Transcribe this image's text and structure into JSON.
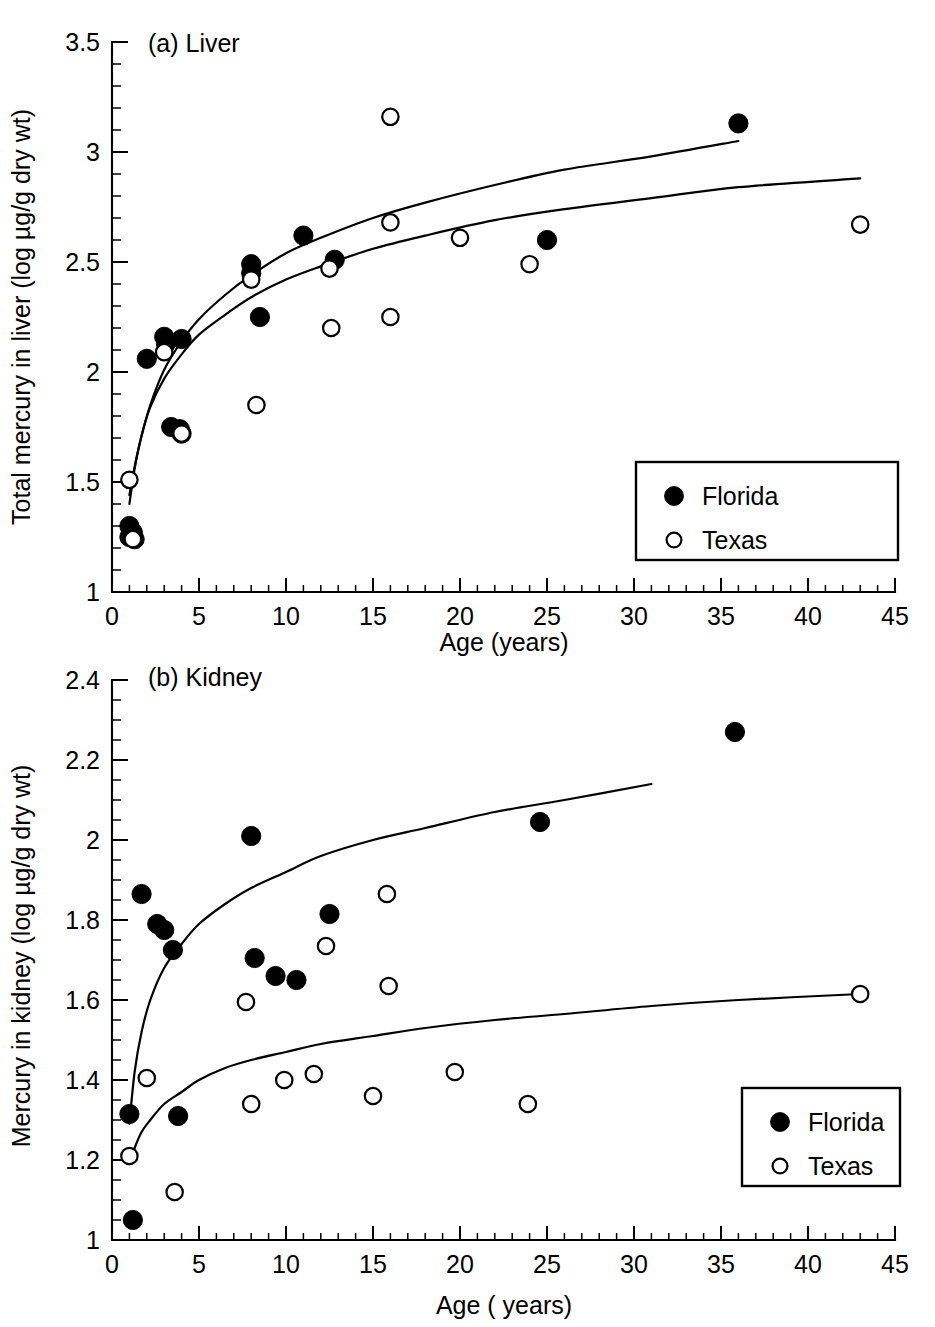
{
  "figure": {
    "background_color": "#ffffff",
    "ink_color": "#000000"
  },
  "chart_data": [
    {
      "id": "liver",
      "type": "scatter",
      "title": "(a) Liver",
      "xlabel": "Age (years)",
      "ylabel": "Total mercury in liver (log µg/g dry wt)",
      "xlim": [
        0,
        45
      ],
      "ylim": [
        1,
        3.5
      ],
      "xticks": [
        0,
        5,
        10,
        15,
        20,
        25,
        30,
        35,
        40,
        45
      ],
      "xtick_labels": [
        "0",
        "5",
        "10",
        "15",
        "20",
        "25",
        "30",
        "35",
        "40",
        "45"
      ],
      "xminor_step": 1,
      "yticks": [
        1,
        1.5,
        2,
        2.5,
        3,
        3.5
      ],
      "ytick_labels": [
        "1",
        "1.5",
        "2",
        "2.5",
        "3",
        "3.5"
      ],
      "yminor_step": 0.1,
      "grid": false,
      "legend_position": "lower right",
      "series": [
        {
          "name": "Florida",
          "marker": "filled-circle",
          "marker_color": "#000000",
          "points": [
            [
              1.0,
              1.3
            ],
            [
              1.0,
              1.25
            ],
            [
              1.2,
              1.27
            ],
            [
              1.3,
              1.24
            ],
            [
              2.0,
              2.06
            ],
            [
              3.0,
              2.16
            ],
            [
              3.1,
              2.13
            ],
            [
              4.0,
              2.15
            ],
            [
              3.4,
              1.75
            ],
            [
              3.9,
              1.74
            ],
            [
              4.0,
              1.72
            ],
            [
              8.0,
              2.49
            ],
            [
              8.0,
              2.45
            ],
            [
              8.5,
              2.25
            ],
            [
              11.0,
              2.62
            ],
            [
              12.8,
              2.51
            ],
            [
              25.0,
              2.6
            ],
            [
              36.0,
              3.13
            ]
          ],
          "fit_curve": {
            "x_range": [
              1.0,
              36.0
            ],
            "points": [
              [
                1.0,
                1.44
              ],
              [
                1.3,
                1.57
              ],
              [
                1.7,
                1.71
              ],
              [
                2.2,
                1.85
              ],
              [
                3.0,
                2.01
              ],
              [
                4.0,
                2.14
              ],
              [
                5.0,
                2.24
              ],
              [
                6.5,
                2.35
              ],
              [
                8.0,
                2.44
              ],
              [
                10.0,
                2.54
              ],
              [
                12.0,
                2.61
              ],
              [
                15.0,
                2.7
              ],
              [
                18.0,
                2.77
              ],
              [
                22.0,
                2.85
              ],
              [
                26.0,
                2.92
              ],
              [
                31.0,
                2.98
              ],
              [
                36.0,
                3.05
              ]
            ]
          }
        },
        {
          "name": "Texas",
          "marker": "open-circle",
          "marker_color": "#ffffff",
          "points": [
            [
              1.0,
              1.51
            ],
            [
              1.2,
              1.24
            ],
            [
              3.0,
              2.09
            ],
            [
              4.0,
              1.72
            ],
            [
              8.0,
              2.42
            ],
            [
              8.3,
              1.85
            ],
            [
              12.5,
              2.47
            ],
            [
              12.6,
              2.2
            ],
            [
              16.0,
              3.16
            ],
            [
              16.0,
              2.68
            ],
            [
              16.0,
              2.25
            ],
            [
              20.0,
              2.61
            ],
            [
              24.0,
              2.49
            ],
            [
              43.0,
              2.67
            ]
          ],
          "fit_curve": {
            "x_range": [
              1.0,
              43.0
            ],
            "points": [
              [
                1.0,
                1.4
              ],
              [
                1.3,
                1.56
              ],
              [
                1.7,
                1.71
              ],
              [
                2.2,
                1.84
              ],
              [
                3.0,
                1.97
              ],
              [
                4.0,
                2.08
              ],
              [
                5.0,
                2.17
              ],
              [
                6.5,
                2.26
              ],
              [
                8.0,
                2.34
              ],
              [
                10.0,
                2.42
              ],
              [
                12.0,
                2.48
              ],
              [
                15.0,
                2.56
              ],
              [
                18.0,
                2.62
              ],
              [
                22.0,
                2.69
              ],
              [
                26.0,
                2.74
              ],
              [
                31.0,
                2.79
              ],
              [
                36.0,
                2.84
              ],
              [
                43.0,
                2.88
              ]
            ]
          }
        }
      ],
      "legend": [
        {
          "label": "Florida",
          "marker": "filled-circle"
        },
        {
          "label": "Texas",
          "marker": "open-circle"
        }
      ]
    },
    {
      "id": "kidney",
      "type": "scatter",
      "title": "(b) Kidney",
      "xlabel": "Age ( years)",
      "ylabel": "Mercury in kidney (log µg/g dry wt)",
      "xlim": [
        0,
        45
      ],
      "ylim": [
        1,
        2.4
      ],
      "xticks": [
        0,
        5,
        10,
        15,
        20,
        25,
        30,
        35,
        40,
        45
      ],
      "xtick_labels": [
        "0",
        "5",
        "10",
        "15",
        "20",
        "25",
        "30",
        "35",
        "40",
        "45"
      ],
      "xminor_step": 1,
      "yticks": [
        1,
        1.2,
        1.4,
        1.6,
        1.8,
        2,
        2.2,
        2.4
      ],
      "ytick_labels": [
        "1",
        "1.2",
        "1.4",
        "1.6",
        "1.8",
        "2",
        "2.2",
        "2.4"
      ],
      "yminor_step": 0.05,
      "grid": false,
      "legend_position": "lower right",
      "series": [
        {
          "name": "Florida",
          "marker": "filled-circle",
          "marker_color": "#000000",
          "points": [
            [
              1.0,
              1.315
            ],
            [
              1.2,
              1.05
            ],
            [
              1.7,
              1.865
            ],
            [
              2.6,
              1.79
            ],
            [
              3.0,
              1.775
            ],
            [
              3.5,
              1.725
            ],
            [
              3.8,
              1.31
            ],
            [
              8.0,
              2.01
            ],
            [
              8.2,
              1.705
            ],
            [
              9.4,
              1.66
            ],
            [
              10.6,
              1.65
            ],
            [
              12.5,
              1.815
            ],
            [
              24.6,
              2.045
            ],
            [
              35.8,
              2.27
            ]
          ],
          "fit_curve": {
            "x_range": [
              1.0,
              31.0
            ],
            "points": [
              [
                1.0,
                1.29
              ],
              [
                1.3,
                1.42
              ],
              [
                1.7,
                1.52
              ],
              [
                2.2,
                1.6
              ],
              [
                3.0,
                1.68
              ],
              [
                4.0,
                1.74
              ],
              [
                5.0,
                1.79
              ],
              [
                6.5,
                1.84
              ],
              [
                8.0,
                1.88
              ],
              [
                10.0,
                1.92
              ],
              [
                12.0,
                1.96
              ],
              [
                15.0,
                2.0
              ],
              [
                18.0,
                2.03
              ],
              [
                22.0,
                2.07
              ],
              [
                26.0,
                2.1
              ],
              [
                31.0,
                2.14
              ]
            ]
          }
        },
        {
          "name": "Texas",
          "marker": "open-circle",
          "marker_color": "#ffffff",
          "points": [
            [
              1.0,
              1.21
            ],
            [
              2.0,
              1.405
            ],
            [
              3.6,
              1.12
            ],
            [
              7.7,
              1.595
            ],
            [
              8.0,
              1.34
            ],
            [
              9.9,
              1.4
            ],
            [
              11.6,
              1.415
            ],
            [
              12.3,
              1.735
            ],
            [
              15.8,
              1.865
            ],
            [
              15.9,
              1.635
            ],
            [
              15.0,
              1.36
            ],
            [
              19.7,
              1.42
            ],
            [
              23.9,
              1.34
            ],
            [
              43.0,
              1.615
            ]
          ],
          "fit_curve": {
            "x_range": [
              1.0,
              43.0
            ],
            "points": [
              [
                1.0,
                1.19
              ],
              [
                1.3,
                1.23
              ],
              [
                1.7,
                1.27
              ],
              [
                2.2,
                1.3
              ],
              [
                3.0,
                1.34
              ],
              [
                4.0,
                1.37
              ],
              [
                5.0,
                1.4
              ],
              [
                6.5,
                1.43
              ],
              [
                8.0,
                1.45
              ],
              [
                10.0,
                1.47
              ],
              [
                12.0,
                1.49
              ],
              [
                15.0,
                1.51
              ],
              [
                18.0,
                1.53
              ],
              [
                22.0,
                1.55
              ],
              [
                26.0,
                1.565
              ],
              [
                31.0,
                1.585
              ],
              [
                36.0,
                1.6
              ],
              [
                43.0,
                1.615
              ]
            ]
          }
        }
      ],
      "legend": [
        {
          "label": "Florida",
          "marker": "filled-circle"
        },
        {
          "label": "Texas",
          "marker": "open-circle"
        }
      ]
    }
  ]
}
